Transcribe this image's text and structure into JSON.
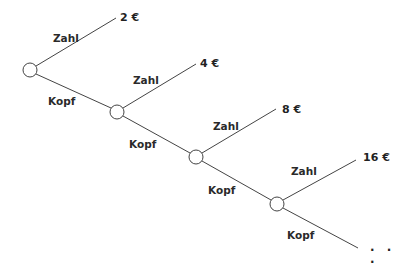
{
  "diagram": {
    "type": "probability-tree",
    "line_color": "#444444",
    "node_fill": "#ffffff",
    "branch_labels": {
      "up": "Zahl",
      "down": "Kopf"
    },
    "stages": [
      {
        "up_label": "Zahl",
        "down_label": "Kopf",
        "payout": "2 €"
      },
      {
        "up_label": "Zahl",
        "down_label": "Kopf",
        "payout": "4 €"
      },
      {
        "up_label": "Zahl",
        "down_label": "Kopf",
        "payout": "8 €"
      },
      {
        "up_label": "Zahl",
        "down_label": "Kopf",
        "payout": "16 €"
      }
    ],
    "continuation": ". . ."
  }
}
